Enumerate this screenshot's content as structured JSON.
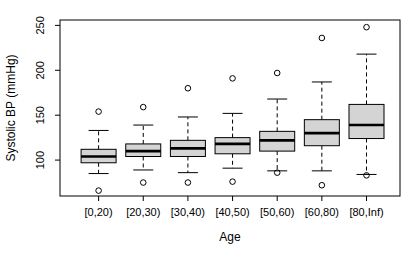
{
  "figure": {
    "xlabel": "Age",
    "ylabel": "Systolic BP (mmHg)"
  },
  "chart_data": {
    "type": "boxplot",
    "title": "",
    "xlabel": "Age",
    "ylabel": "Systolic BP (mmHg)",
    "categories": [
      "[0,20)",
      "[20,30)",
      "[30,40)",
      "[40,50)",
      "[50,60)",
      "[60,80)",
      "[80,Inf)"
    ],
    "y_ticks": [
      100,
      150,
      200,
      250
    ],
    "ylim": [
      60,
      256
    ],
    "grid": false,
    "legend": "none",
    "series": [
      {
        "category": "[0,20)",
        "whisker_low": 85,
        "q1": 97,
        "median": 104,
        "q3": 112,
        "whisker_high": 133,
        "outliers": [
          66,
          154
        ]
      },
      {
        "category": "[20,30)",
        "whisker_low": 89,
        "q1": 104,
        "median": 110,
        "q3": 118,
        "whisker_high": 139,
        "outliers": [
          75,
          159
        ]
      },
      {
        "category": "[30,40)",
        "whisker_low": 86,
        "q1": 104,
        "median": 113,
        "q3": 122,
        "whisker_high": 148,
        "outliers": [
          75,
          180
        ]
      },
      {
        "category": "[40,50)",
        "whisker_low": 91,
        "q1": 107,
        "median": 118,
        "q3": 125,
        "whisker_high": 152,
        "outliers": [
          76,
          191
        ]
      },
      {
        "category": "[50,60)",
        "whisker_low": 88,
        "q1": 110,
        "median": 122,
        "q3": 132,
        "whisker_high": 168,
        "outliers": [
          86,
          197
        ]
      },
      {
        "category": "[60,80)",
        "whisker_low": 88,
        "q1": 116,
        "median": 130,
        "q3": 145,
        "whisker_high": 187,
        "outliers": [
          72,
          236
        ]
      },
      {
        "category": "[80,Inf)",
        "whisker_low": 84,
        "q1": 124,
        "median": 139,
        "q3": 162,
        "whisker_high": 218,
        "outliers": [
          83,
          248
        ]
      }
    ],
    "colors": {
      "box_fill": "#d4d4d4",
      "stroke": "#000000",
      "background": "#ffffff",
      "text": "#000000"
    }
  }
}
